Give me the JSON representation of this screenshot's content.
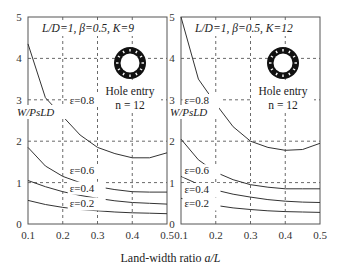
{
  "figure": {
    "xlabel_prefix": "Land-width ratio ",
    "xlabel_var": "a/L"
  },
  "chart_data": [
    {
      "type": "line",
      "title": "L/D=1, β=0.5, K=9",
      "inset_label": "Hole entry",
      "inset_n": "n = 12",
      "xlabel": "Land-width ratio a/L",
      "ylabel": "W/PsLD",
      "xlim": [
        0.1,
        0.5
      ],
      "ylim": [
        0,
        5
      ],
      "xticks": [
        "0.1",
        "0.2",
        "0.3",
        "0.4",
        "0.5"
      ],
      "yticks": [
        "0",
        "1",
        "2",
        "3",
        "4",
        "5"
      ],
      "grid": true,
      "x": [
        0.1,
        0.15,
        0.2,
        0.25,
        0.3,
        0.35,
        0.4,
        0.45,
        0.5
      ],
      "series": [
        {
          "name": "ε=0.8",
          "values": [
            4.35,
            3.05,
            2.6,
            2.15,
            1.85,
            1.7,
            1.6,
            1.6,
            1.72
          ]
        },
        {
          "name": "ε=0.6",
          "values": [
            1.85,
            1.4,
            1.15,
            1.0,
            0.9,
            0.83,
            0.78,
            0.77,
            0.77
          ]
        },
        {
          "name": "ε=0.4",
          "values": [
            1.05,
            0.9,
            0.78,
            0.69,
            0.62,
            0.56,
            0.52,
            0.5,
            0.48
          ]
        },
        {
          "name": "ε=0.2",
          "values": [
            0.57,
            0.47,
            0.4,
            0.35,
            0.32,
            0.29,
            0.27,
            0.26,
            0.25
          ]
        }
      ],
      "label_positions": [
        {
          "name": "ε=0.8",
          "x": 0.22,
          "y": 2.9
        },
        {
          "name": "ε=0.6",
          "x": 0.22,
          "y": 1.2
        },
        {
          "name": "ε=0.4",
          "x": 0.22,
          "y": 0.78
        },
        {
          "name": "ε=0.2",
          "x": 0.22,
          "y": 0.4
        }
      ]
    },
    {
      "type": "line",
      "title": "L/D=1, β=0.5, K=12",
      "inset_label": "Hole entry",
      "inset_n": "n = 12",
      "xlabel": "Land-width ratio a/L",
      "ylabel": "W/PsLD",
      "xlim": [
        0.1,
        0.5
      ],
      "ylim": [
        0,
        5
      ],
      "xticks": [
        "0.1",
        "0.2",
        "0.3",
        "0.4",
        "0.5"
      ],
      "yticks": [
        "0",
        "1",
        "2",
        "3",
        "4",
        "5"
      ],
      "grid": true,
      "x": [
        0.1,
        0.15,
        0.2,
        0.25,
        0.3,
        0.35,
        0.4,
        0.45,
        0.5
      ],
      "series": [
        {
          "name": "ε=0.8",
          "values": [
            5.0,
            3.5,
            2.9,
            2.35,
            2.0,
            1.85,
            1.78,
            1.8,
            1.95
          ]
        },
        {
          "name": "ε=0.6",
          "values": [
            2.05,
            1.55,
            1.25,
            1.07,
            0.95,
            0.89,
            0.85,
            0.85,
            0.85
          ]
        },
        {
          "name": "ε=0.4",
          "values": [
            1.15,
            0.96,
            0.82,
            0.72,
            0.65,
            0.59,
            0.55,
            0.53,
            0.52
          ]
        },
        {
          "name": "ε=0.2",
          "values": [
            0.62,
            0.52,
            0.45,
            0.39,
            0.35,
            0.32,
            0.3,
            0.29,
            0.28
          ]
        }
      ],
      "label_positions": [
        {
          "name": "ε=0.8",
          "x": 0.11,
          "y": 2.9
        },
        {
          "name": "ε=0.6",
          "x": 0.11,
          "y": 1.2
        },
        {
          "name": "ε=0.4",
          "x": 0.11,
          "y": 0.75
        },
        {
          "name": "ε=0.2",
          "x": 0.11,
          "y": 0.4
        }
      ]
    }
  ]
}
